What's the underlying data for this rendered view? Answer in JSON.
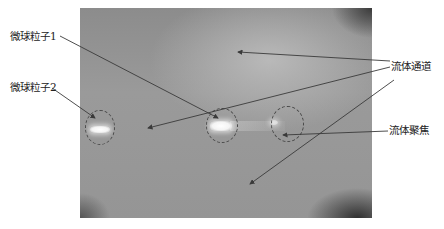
{
  "figure": {
    "type": "annotated-microscope-image",
    "labels": {
      "particle1": "微球粒子1",
      "particle2": "微球粒子2",
      "channel": "流体通道",
      "focus": "流体聚焦"
    },
    "colors": {
      "annotation_line": "#3a3a3a",
      "background_gray": "#959595",
      "particle_glow": "#ffffff"
    }
  }
}
